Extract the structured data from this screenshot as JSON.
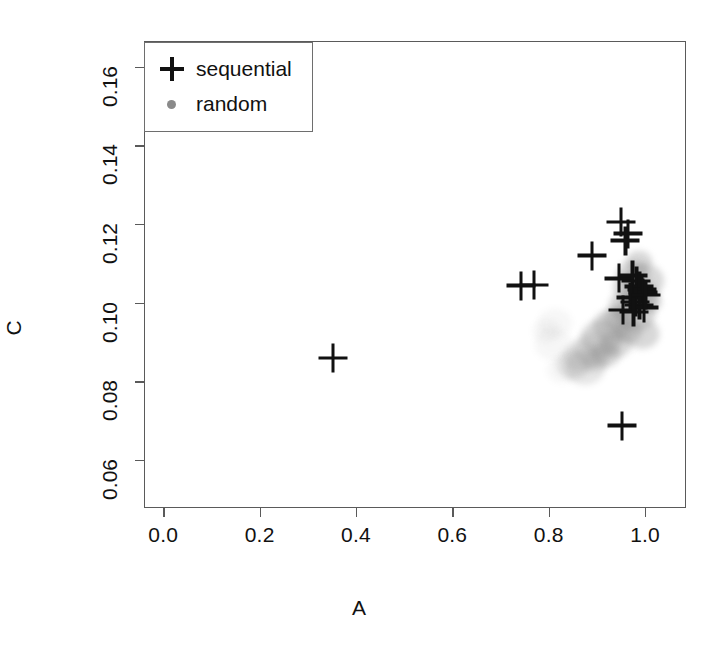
{
  "chart_data": {
    "type": "scatter",
    "title": "",
    "xlabel": "A",
    "ylabel": "C",
    "xlim": [
      -0.04,
      1.085
    ],
    "ylim": [
      0.0478,
      0.1665
    ],
    "xticks": [
      "0.0",
      "0.2",
      "0.4",
      "0.6",
      "0.8",
      "1.0"
    ],
    "xtickvalues": [
      0.0,
      0.2,
      0.4,
      0.6,
      0.8,
      1.0
    ],
    "yticks": [
      "0.06",
      "0.08",
      "0.10",
      "0.12",
      "0.14",
      "0.16"
    ],
    "ytickvalues": [
      0.06,
      0.08,
      0.1,
      0.12,
      0.14,
      0.16
    ],
    "grid": false,
    "legend_position": "top-left-inside",
    "series": [
      {
        "name": "sequential",
        "marker": "plus",
        "color": "#111111",
        "points": [
          [
            0.35,
            0.0862
          ],
          [
            0.74,
            0.1046
          ],
          [
            0.768,
            0.1048
          ],
          [
            0.888,
            0.1122
          ],
          [
            0.948,
            0.1208
          ],
          [
            0.963,
            0.1178
          ],
          [
            0.957,
            0.116
          ],
          [
            0.944,
            0.1064
          ],
          [
            0.972,
            0.1072
          ],
          [
            0.98,
            0.1058
          ],
          [
            0.986,
            0.1044
          ],
          [
            0.991,
            0.1036
          ],
          [
            0.994,
            0.1028
          ],
          [
            0.968,
            0.1016
          ],
          [
            0.978,
            0.1004
          ],
          [
            0.986,
            0.0996
          ],
          [
            0.996,
            0.099
          ],
          [
            0.999,
            0.1022
          ],
          [
            0.952,
            0.0984
          ],
          [
            0.974,
            0.0978
          ],
          [
            0.95,
            0.069
          ]
        ]
      },
      {
        "name": "random",
        "marker": "circle",
        "color": "#8e8e8e",
        "points": [
          [
            0.985,
            0.1106
          ],
          [
            0.972,
            0.1074
          ],
          [
            0.996,
            0.1058
          ],
          [
            0.962,
            0.1042
          ],
          [
            0.988,
            0.102
          ],
          [
            1.004,
            0.1004
          ],
          [
            0.958,
            0.0996
          ],
          [
            0.978,
            0.0974
          ],
          [
            0.944,
            0.0962
          ],
          [
            0.93,
            0.0944
          ],
          [
            0.962,
            0.093
          ],
          [
            0.992,
            0.0922
          ],
          [
            0.908,
            0.0912
          ],
          [
            0.938,
            0.0898
          ],
          [
            0.89,
            0.0884
          ],
          [
            0.916,
            0.0872
          ],
          [
            0.868,
            0.0866
          ],
          [
            0.896,
            0.0854
          ],
          [
            0.848,
            0.0846
          ],
          [
            0.874,
            0.0838
          ],
          [
            0.826,
            0.0832
          ],
          [
            0.806,
            0.0898
          ],
          [
            0.792,
            0.093
          ],
          [
            0.812,
            0.0952
          ]
        ]
      }
    ]
  },
  "legend": {
    "items": [
      {
        "label": "sequential",
        "key": "plus-marker"
      },
      {
        "label": "random",
        "key": "dot-marker"
      }
    ]
  },
  "axes": {
    "x_title": "A",
    "y_title": "C"
  }
}
